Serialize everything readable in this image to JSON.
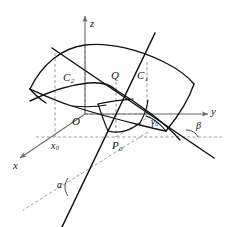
{
  "figure": {
    "background_color": "#ffffff",
    "stroke_color": "#111111",
    "dashed_color": "#9a9a9a",
    "thin_color": "#6b6b6b",
    "width": 231,
    "height": 227
  },
  "axes": {
    "z_label": "z",
    "y_label": "y",
    "x_label": "x",
    "origin_label": "O"
  },
  "points": {
    "q_label": "Q",
    "p0_label": "P",
    "p0_sub": "0",
    "x0_label": "x",
    "x0_sub": "0",
    "gamma0_label": "γ",
    "gamma0_sub": "0"
  },
  "curves": {
    "c1_label": "C",
    "c1_sub": "1",
    "c2_label": "C",
    "c2_sub": "2"
  },
  "angles": {
    "alpha_label": "α",
    "beta_label": "β"
  }
}
